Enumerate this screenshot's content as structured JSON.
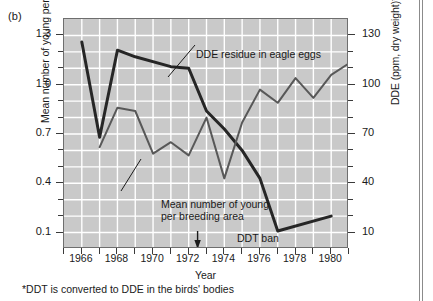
{
  "figure": {
    "panel_letter": "(b)",
    "footnote": "*DDT is converted to DDE in the birds' bodies"
  },
  "annotations": {
    "dde_label": "DDE residue in eagle eggs",
    "young_label_line1": "Mean number of young",
    "young_label_line2": "per breeding area",
    "ddt_ban_label": "DDT ban"
  },
  "chart_data": {
    "type": "line",
    "title": "",
    "subtitle": "",
    "xlabel": "Year",
    "ylabel": "Mean number of young per breeding area",
    "y2label": "DDE (ppm, dry weight)*",
    "xlim": [
      1965,
      1981
    ],
    "ylim": [
      0.0,
      1.4
    ],
    "y2lim": [
      0,
      140
    ],
    "grid": true,
    "legend_position": "inline-annotations",
    "background_color": "#c9c9c9",
    "gridline_color": "#ffffff",
    "x_ticks": [
      1965,
      1966,
      1967,
      1968,
      1969,
      1970,
      1971,
      1972,
      1973,
      1974,
      1975,
      1976,
      1977,
      1978,
      1979,
      1980,
      1981
    ],
    "x_tick_labels": [
      "",
      "1966",
      "",
      "1968",
      "",
      "1970",
      "",
      "1972",
      "",
      "1974",
      "",
      "1976",
      "",
      "1978",
      "",
      "1980",
      ""
    ],
    "y_ticks_left": [
      0.1,
      0.4,
      0.7,
      1.0,
      1.3
    ],
    "y_tick_labels_left": [
      "0.1",
      "0.4",
      "0.7",
      "1.0",
      "1.3"
    ],
    "y_minor_ticks_left": [
      0.2,
      0.3,
      0.5,
      0.6,
      0.8,
      0.9,
      1.1,
      1.2
    ],
    "y_ticks_right": [
      10,
      40,
      70,
      100,
      130
    ],
    "y_tick_labels_right": [
      "10",
      "40",
      "70",
      "100",
      "130"
    ],
    "y_minor_ticks_right": [
      20,
      30,
      50,
      60,
      80,
      90,
      110,
      120
    ],
    "annotation_marker": {
      "label": "DDT ban",
      "x": 1972.5
    },
    "series": [
      {
        "name": "DDE residue in eagle eggs",
        "axis": "right",
        "color": "#262626",
        "width": 3.0,
        "x": [
          1966,
          1967,
          1968,
          1969,
          1971,
          1972,
          1973,
          1974,
          1975,
          1976,
          1977,
          1980
        ],
        "values": [
          126,
          68,
          121,
          117,
          111,
          110,
          84,
          73,
          60,
          43,
          11,
          20
        ]
      },
      {
        "name": "Mean number of young per breeding area",
        "axis": "left",
        "color": "#585858",
        "width": 2.0,
        "x": [
          1967,
          1968,
          1969,
          1970,
          1971,
          1972,
          1973,
          1974,
          1975,
          1976,
          1977,
          1978,
          1979,
          1980,
          1981
        ],
        "values": [
          0.62,
          0.86,
          0.84,
          0.58,
          0.65,
          0.57,
          0.8,
          0.43,
          0.77,
          0.97,
          0.89,
          1.04,
          0.92,
          1.06,
          1.13
        ]
      }
    ]
  }
}
